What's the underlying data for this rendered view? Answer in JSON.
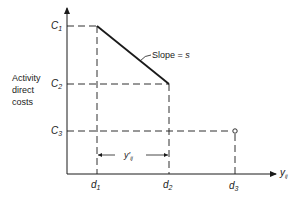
{
  "diagram": {
    "type": "cost-duration diagram",
    "y_axis_label_lines": [
      "Activity",
      "direct",
      "costs"
    ],
    "x_axis_label": "y",
    "x_axis_label_sub": "ij",
    "y_ticks": [
      {
        "label": "C",
        "sub": "1"
      },
      {
        "label": "C",
        "sub": "2"
      },
      {
        "label": "C",
        "sub": "3"
      }
    ],
    "x_ticks": [
      {
        "label": "d",
        "sub": "1"
      },
      {
        "label": "d",
        "sub": "2"
      },
      {
        "label": "d",
        "sub": "3"
      }
    ],
    "slope_label": "Slope = ",
    "slope_symbol": "s",
    "interval_label": "y′",
    "interval_label_sub": "ij",
    "line_color": "#1a1a1a",
    "background": "#ffffff"
  }
}
